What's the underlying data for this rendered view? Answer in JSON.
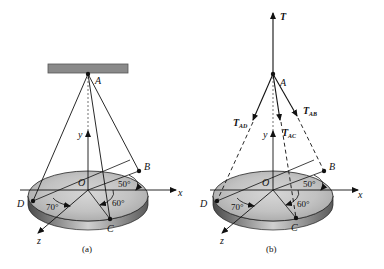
{
  "figure_a": {
    "caption": "(a)",
    "points": {
      "A": "A",
      "B": "B",
      "C": "C",
      "D": "D",
      "O": "O"
    },
    "axes": {
      "x": "x",
      "y": "y",
      "z": "z"
    },
    "angles": {
      "B": "50°",
      "C": "60°",
      "D": "70°"
    }
  },
  "figure_b": {
    "caption": "(b)",
    "points": {
      "A": "A",
      "B": "B",
      "C": "C",
      "D": "D",
      "O": "O"
    },
    "axes": {
      "x": "x",
      "y": "y",
      "z": "z"
    },
    "angles": {
      "B": "50°",
      "C": "60°",
      "D": "70°"
    },
    "forces": {
      "T": "T",
      "T_AD": {
        "main": "T",
        "sub": "AD"
      },
      "T_AC": {
        "main": "T",
        "sub": "AC"
      },
      "T_AB": {
        "main": "T",
        "sub": "AB"
      }
    }
  },
  "colors": {
    "ceiling": "#8a8a8a",
    "disk_top": "#c8c8c8",
    "disk_edge": "#9a9a9a",
    "line": "#111111"
  }
}
